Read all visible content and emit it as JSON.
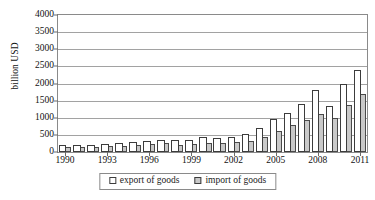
{
  "chart_data": {
    "type": "bar",
    "title": "",
    "subtitle": "",
    "xlabel": "",
    "ylabel": "billion USD",
    "ylim": [
      0,
      4000
    ],
    "ytick_step": 500,
    "yticks": [
      "0",
      "500",
      "1000",
      "1500",
      "2000",
      "2500",
      "3000",
      "3500",
      "4000"
    ],
    "grid": true,
    "grid_axis": "y",
    "legend_position": "bottom",
    "bar_style": "clustered-overlapped",
    "categories": [
      "1990",
      "1991",
      "1992",
      "1993",
      "1994",
      "1995",
      "1996",
      "1997",
      "1998",
      "1999",
      "2000",
      "2001",
      "2002",
      "2003",
      "2004",
      "2005",
      "2006",
      "2007",
      "2008",
      "2009",
      "2010",
      "2011"
    ],
    "xtick_labels": [
      "1990",
      "1993",
      "1996",
      "1999",
      "2002",
      "2005",
      "2008",
      "2011"
    ],
    "xtick_indices": [
      0,
      3,
      6,
      9,
      12,
      15,
      18,
      21
    ],
    "series": [
      {
        "name": "export of goods",
        "color": "#ffffff",
        "edge_color": "#3c3c3c",
        "values": [
          195,
          205,
          215,
          230,
          265,
          300,
          325,
          365,
          350,
          365,
          430,
          420,
          450,
          540,
          700,
          960,
          1150,
          1400,
          1800,
          1350,
          2000,
          2400
        ]
      },
      {
        "name": "import of goods",
        "color": "#c9c9c9",
        "edge_color": "#4a4a4a",
        "values": [
          135,
          145,
          155,
          165,
          185,
          210,
          225,
          250,
          210,
          225,
          270,
          255,
          290,
          330,
          440,
          610,
          790,
          940,
          1120,
          980,
          1380,
          1700
        ]
      }
    ]
  },
  "legend": {
    "items": [
      {
        "label": "export of goods",
        "swatch": "export-swatch"
      },
      {
        "label": "import of goods",
        "swatch": "import-swatch"
      }
    ]
  }
}
